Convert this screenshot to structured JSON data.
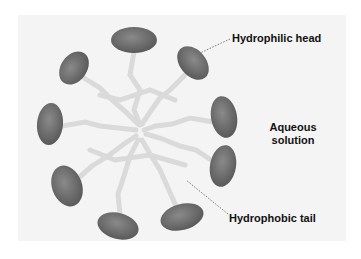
{
  "diagram": {
    "type": "micelle",
    "labels": {
      "head": "Hydrophilic head",
      "solution_line1": "Aqueous",
      "solution_line2": "solution",
      "tail": "Hydrophobic tail"
    },
    "colors": {
      "head": "#6e6e6e",
      "tail": "#d9d9d9",
      "background": "#f4f4f4",
      "text": "#111111"
    }
  }
}
